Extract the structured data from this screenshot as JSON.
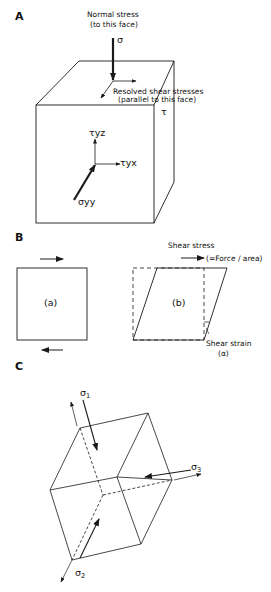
{
  "panels": {
    "A": {
      "label": "A",
      "normal_stress_title": "Normal stress",
      "normal_stress_sub": "(to this face)",
      "normal_symbol": "σ",
      "shear_title": "Resolved shear stresses",
      "shear_sub": "(parallel to this face)",
      "tau_symbol": "τ",
      "tau_yz": "τyz",
      "tau_yx": "τyx",
      "sigma_yy": "σyy"
    },
    "B": {
      "label": "B",
      "shear_stress_title": "Shear stress",
      "shear_stress_sub": "(=Force / area)",
      "square_a": "(a)",
      "square_b": "(b)",
      "shear_strain_title": "Shear strain",
      "shear_strain_symbol": "(α)"
    },
    "C": {
      "label": "C",
      "sigma_1": "σ",
      "sigma_1_sub": "1",
      "sigma_2": "σ",
      "sigma_2_sub": "2",
      "sigma_3": "σ",
      "sigma_3_sub": "3"
    }
  },
  "colors": {
    "line": "#1a1a1a",
    "background": "#ffffff"
  }
}
